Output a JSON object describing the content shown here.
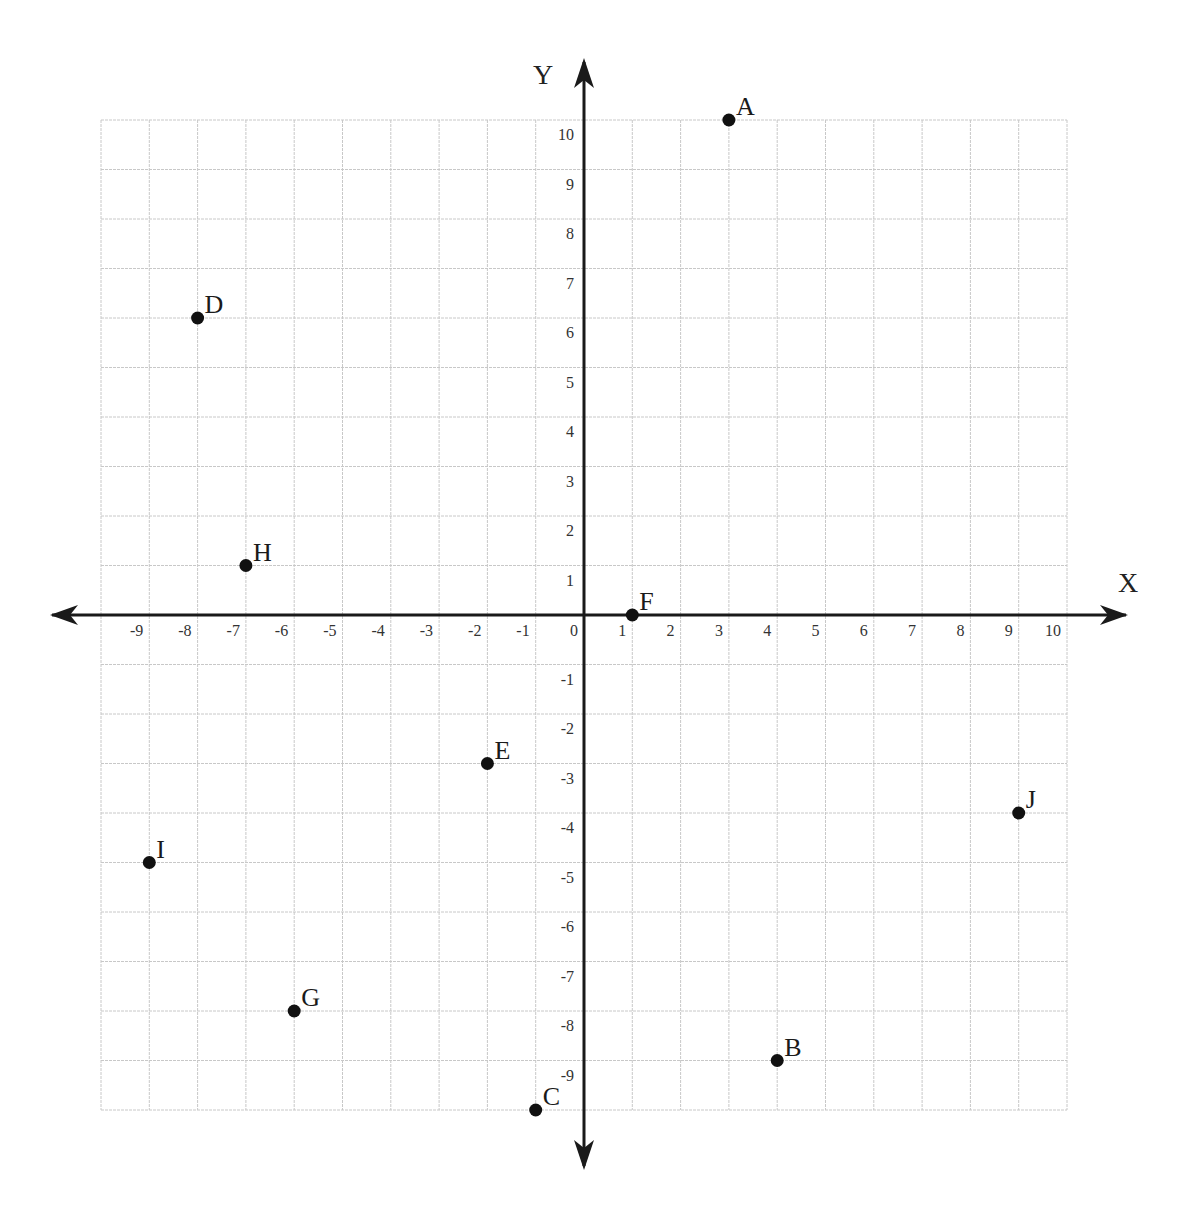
{
  "chart_data": {
    "type": "scatter",
    "title": "",
    "xlabel": "X",
    "ylabel": "Y",
    "xlim": [
      -10,
      10
    ],
    "ylim": [
      -10,
      10
    ],
    "grid": true,
    "x_ticks": [
      -9,
      -8,
      -7,
      -6,
      -5,
      -4,
      -3,
      -2,
      -1,
      0,
      1,
      2,
      3,
      4,
      5,
      6,
      7,
      8,
      9,
      10
    ],
    "y_ticks": [
      10,
      9,
      8,
      7,
      6,
      5,
      4,
      3,
      2,
      1,
      -1,
      -2,
      -3,
      -4,
      -5,
      -6,
      -7,
      -8,
      -9
    ],
    "points": [
      {
        "label": "A",
        "x": 3,
        "y": 10
      },
      {
        "label": "B",
        "x": 4,
        "y": -9
      },
      {
        "label": "C",
        "x": -1,
        "y": -10
      },
      {
        "label": "D",
        "x": -8,
        "y": 6
      },
      {
        "label": "E",
        "x": -2,
        "y": -3
      },
      {
        "label": "F",
        "x": 1,
        "y": 0
      },
      {
        "label": "G",
        "x": -6,
        "y": -8
      },
      {
        "label": "H",
        "x": -7,
        "y": 1
      },
      {
        "label": "I",
        "x": -9,
        "y": -5
      },
      {
        "label": "J",
        "x": 9,
        "y": -4
      }
    ],
    "legend": null
  },
  "colors": {
    "grid": "#c8c8c8",
    "axis": "#1a1a1a",
    "point": "#111111",
    "background": "#ffffff"
  },
  "layout": {
    "origin_px": [
      584,
      615
    ],
    "x_unit_px": 48.3,
    "y_unit_px": 49.5
  }
}
